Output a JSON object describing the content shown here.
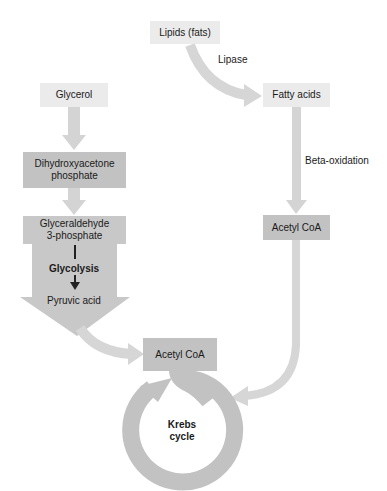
{
  "diagram": {
    "nodes": {
      "lipids": "Lipids (fats)",
      "fatty_acids": "Fatty acids",
      "glycerol": "Glycerol",
      "dhap": "Dihydroxyacetone phosphate",
      "dhap_line1": "Dihydroxyacetone",
      "dhap_line2": "phosphate",
      "g3p_line1": "Glyceraldehyde",
      "g3p_line2": "3-phosphate",
      "pyruvic_acid": "Pyruvic acid",
      "acetyl_coa_right": "Acetyl CoA",
      "acetyl_coa_center": "Acetyl CoA",
      "krebs_line1": "Krebs",
      "krebs_line2": "cycle"
    },
    "edge_labels": {
      "lipase": "Lipase",
      "beta_oxidation": "Beta-oxidation",
      "glycolysis": "Glycolysis"
    },
    "colors": {
      "light_box": "#ebebeb",
      "dark_box": "#c2c2c2",
      "arrow": "#d4d4d4",
      "cycle": "#c2c2c2",
      "text": "#1a1a1a"
    }
  }
}
